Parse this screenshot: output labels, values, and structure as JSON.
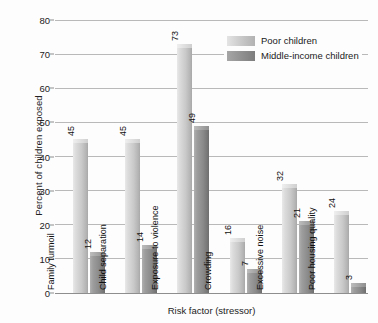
{
  "chart_data": {
    "type": "bar",
    "title": "",
    "xlabel": "Risk factor (stressor)",
    "ylabel": "Percent of children exposed",
    "categories": [
      "Family turmoil",
      "Child separation",
      "Exposure to violence",
      "Crowding",
      "Excessive noise",
      "Poor housing quality"
    ],
    "series": [
      {
        "name": "Poor children",
        "color": "#c9c9c9",
        "values": [
          45,
          45,
          73,
          16,
          32,
          24
        ]
      },
      {
        "name": "Middle-income children",
        "color": "#8a8a8a",
        "values": [
          12,
          14,
          49,
          7,
          21,
          3
        ]
      }
    ],
    "ylim": [
      0,
      80
    ],
    "yticks": [
      0,
      10,
      20,
      30,
      40,
      50,
      60,
      70,
      80
    ],
    "ytick_labels": [
      "0",
      "10",
      "20",
      "30",
      "40",
      "50",
      "60",
      "70",
      "80"
    ],
    "grid": true,
    "legend_position": "top-right",
    "value_labels": true,
    "value_label_rotation": -90,
    "category_label_rotation": -90
  },
  "legend": {
    "items": [
      {
        "label": "Poor children",
        "swatch": "light"
      },
      {
        "label": "Middle-income children",
        "swatch": "dark"
      }
    ]
  }
}
